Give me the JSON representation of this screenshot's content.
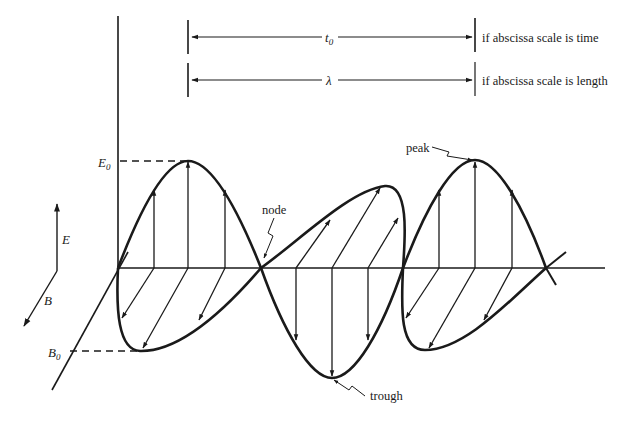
{
  "diagram": {
    "dimension_lines": [
      {
        "symbol": "t",
        "subscript": "0",
        "label": "if abscissa scale is time"
      },
      {
        "symbol": "λ",
        "subscript": "",
        "label": "if abscissa scale is length"
      }
    ],
    "axis_labels": {
      "E": "E",
      "B": "B",
      "E0_main": "E",
      "E0_sub": "0",
      "B0_main": "B",
      "B0_sub": "0"
    },
    "annotations": {
      "node": "node",
      "peak": "peak",
      "trough": "trough"
    },
    "colors": {
      "ink": "#1a1a1a",
      "background": "#ffffff"
    }
  }
}
